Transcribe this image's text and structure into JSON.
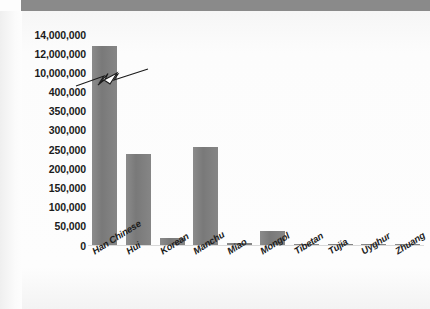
{
  "header": {
    "bar_color": "#8a8a8a"
  },
  "chart_data": {
    "type": "bar",
    "title": "",
    "subtitle": "",
    "xlabel": "",
    "ylabel": "",
    "categories": [
      "Han Chinese",
      "Hui",
      "Korean",
      "Manchu",
      "Miao",
      "Mongol",
      "Tibetan",
      "Tujia",
      "Uyghur",
      "Zhuang"
    ],
    "values": [
      12900000,
      240000,
      20000,
      257000,
      7000,
      38000,
      3000,
      6000,
      3000,
      6000
    ],
    "value_labels": [
      "12,900,000",
      "240,000",
      "20,000",
      "257,000",
      "7,000",
      "38,000",
      "3,000",
      "6,000",
      "3,000",
      "6,000"
    ],
    "bar_color": "#7e7e7e",
    "grid": false,
    "legend": "none",
    "axis_break": true,
    "axis_break_note": "y-axis is broken between 400,000 and 10,000,000",
    "ytick_labels": [
      "14,000,000",
      "12,000,000",
      "10,000,000",
      "400,000",
      "350,000",
      "300,000",
      "250,000",
      "200,000",
      "150,000",
      "100,000",
      "50,000",
      "0"
    ],
    "ytick_values": [
      14000000,
      12000000,
      10000000,
      400000,
      350000,
      300000,
      250000,
      200000,
      150000,
      100000,
      50000,
      0
    ],
    "ylim": [
      0,
      14000000
    ]
  }
}
